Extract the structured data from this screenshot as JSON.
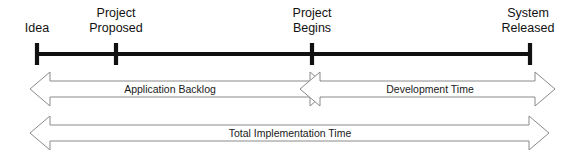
{
  "figure": {
    "name": "software-project-timeline",
    "background_color": "#ffffff",
    "line_color": "#111111",
    "arrow_stroke_color": "#8a8a8a",
    "arrow_fill_color": "#ffffff"
  },
  "timeline": {
    "axis_label": "project timeline axis",
    "milestones": [
      {
        "id": "idea",
        "label_line1": "Idea",
        "label_line2": "",
        "x": 37,
        "anchor": "middle"
      },
      {
        "id": "project-proposed",
        "label_line1": "Project",
        "label_line2": "Proposed",
        "x": 116,
        "anchor": "middle"
      },
      {
        "id": "project-begins",
        "label_line1": "Project",
        "label_line2": "Begins",
        "x": 312,
        "anchor": "middle"
      },
      {
        "id": "system-released",
        "label_line1": "System",
        "label_line2": "Released",
        "x": 530,
        "anchor": "middle"
      }
    ]
  },
  "spans": [
    {
      "id": "application-backlog",
      "label": "Application Backlog",
      "from_milestone": "idea",
      "to_milestone": "project-begins",
      "x_start": 30,
      "x_end": 330,
      "row": "upper",
      "double_headed": true
    },
    {
      "id": "development-time",
      "label": "Development Time",
      "from_milestone": "project-proposed",
      "to_milestone": "system-released",
      "x_start": 300,
      "x_end": 555,
      "row": "upper",
      "double_headed": true
    },
    {
      "id": "total-implementation-time",
      "label": "Total Implementation Time",
      "from_milestone": "idea",
      "to_milestone": "system-released",
      "x_start": 30,
      "x_end": 549,
      "row": "lower",
      "double_headed": true
    }
  ]
}
